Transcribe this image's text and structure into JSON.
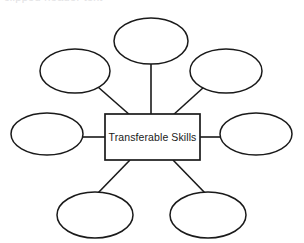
{
  "page": {
    "background_color": "#ffffff",
    "stroke_color": "#1a1a1a",
    "text_color": "#1a1a1a",
    "width": 304,
    "height": 243,
    "top_clipped_text": "clipped header text"
  },
  "diagram": {
    "type": "mind-map",
    "center": {
      "label": "Transferable Skills",
      "shape": "rectangle",
      "x": 105,
      "y": 114,
      "width": 95,
      "height": 46
    },
    "branch_count": 8,
    "branches": [
      {
        "id": "top",
        "label": "",
        "shape": "ellipse",
        "cx": 151,
        "cy": 41,
        "rx": 37,
        "ry": 23,
        "connector": "vertical"
      },
      {
        "id": "top-left",
        "label": "",
        "shape": "ellipse",
        "cx": 75,
        "cy": 71,
        "rx": 35,
        "ry": 22,
        "connector": "diagonal"
      },
      {
        "id": "top-right",
        "label": "",
        "shape": "ellipse",
        "cx": 226,
        "cy": 71,
        "rx": 36,
        "ry": 22,
        "connector": "diagonal"
      },
      {
        "id": "left",
        "label": "",
        "shape": "ellipse",
        "cx": 47,
        "cy": 134,
        "rx": 36,
        "ry": 21,
        "connector": "horizontal"
      },
      {
        "id": "right",
        "label": "",
        "shape": "ellipse",
        "cx": 256,
        "cy": 134,
        "rx": 36,
        "ry": 21,
        "connector": "horizontal"
      },
      {
        "id": "bottom-left",
        "label": "",
        "shape": "ellipse",
        "cx": 95,
        "cy": 215,
        "rx": 38,
        "ry": 23,
        "connector": "diagonal"
      },
      {
        "id": "bottom-right",
        "label": "",
        "shape": "ellipse",
        "cx": 208,
        "cy": 215,
        "rx": 38,
        "ry": 23,
        "connector": "diagonal"
      }
    ]
  }
}
